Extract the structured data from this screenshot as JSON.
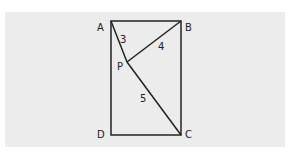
{
  "diagram": {
    "points": {
      "A": {
        "label": "A",
        "x": 111,
        "y": 21
      },
      "B": {
        "label": "B",
        "x": 181,
        "y": 21
      },
      "C": {
        "label": "C",
        "x": 181,
        "y": 135
      },
      "D": {
        "label": "D",
        "x": 111,
        "y": 135
      },
      "P": {
        "label": "P",
        "x": 127,
        "y": 62
      }
    },
    "segments": [
      {
        "from": "A",
        "to": "P",
        "length_label": "3"
      },
      {
        "from": "B",
        "to": "P",
        "length_label": "4"
      },
      {
        "from": "C",
        "to": "P",
        "length_label": "5"
      }
    ],
    "colors": {
      "background": "#ececec",
      "stroke": "#222222"
    }
  }
}
